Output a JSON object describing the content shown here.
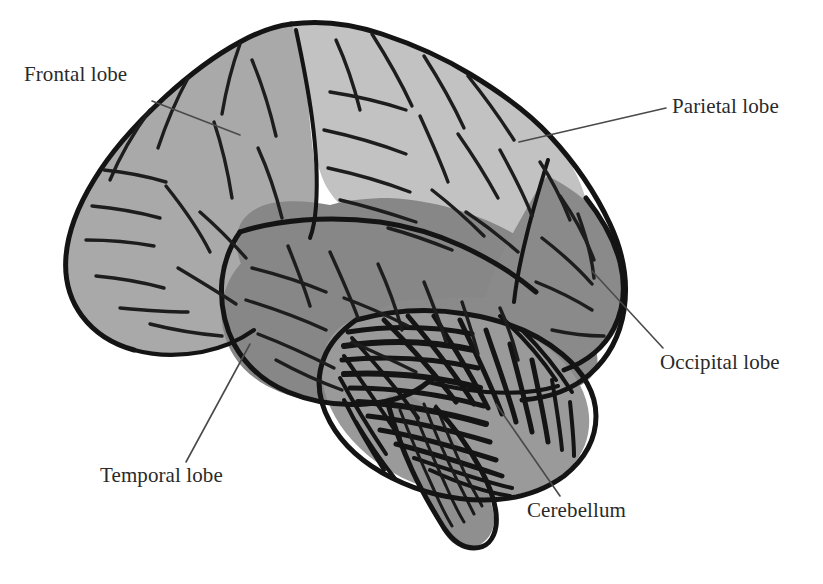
{
  "figure": {
    "type": "anatomical-diagram",
    "background_color": "#ffffff",
    "outline_color": "#1a1a1a",
    "leader_line_color": "#4a4a4a"
  },
  "labels": {
    "frontal": "Frontal lobe",
    "parietal": "Parietal lobe",
    "occipital": "Occipital lobe",
    "temporal": "Temporal lobe",
    "cerebellum": "Cerebellum"
  },
  "regions": [
    {
      "key": "frontal",
      "label": "Frontal lobe",
      "fill": "#a9a9a9"
    },
    {
      "key": "parietal",
      "label": "Parietal lobe",
      "fill": "#c2c2c2"
    },
    {
      "key": "occipital",
      "label": "Occipital lobe",
      "fill": "#8a8a8a"
    },
    {
      "key": "temporal",
      "label": "Temporal lobe",
      "fill": "#878787"
    },
    {
      "key": "cerebellum",
      "label": "Cerebellum",
      "fill": "#9a9a9a"
    },
    {
      "key": "brainstem",
      "label": "",
      "fill": "#8f8f8f"
    }
  ],
  "leader_lines": [
    {
      "key": "frontal",
      "from": [
        152,
        101
      ],
      "to": [
        240,
        135
      ]
    },
    {
      "key": "parietal",
      "from": [
        666,
        108
      ],
      "to": [
        519,
        142
      ]
    },
    {
      "key": "occipital",
      "from": [
        663,
        348
      ],
      "to": [
        592,
        271
      ]
    },
    {
      "key": "temporal",
      "from": [
        186,
        462
      ],
      "to": [
        250,
        344
      ]
    },
    {
      "key": "cerebellum",
      "from": [
        560,
        496
      ],
      "to": [
        496,
        404
      ]
    }
  ]
}
